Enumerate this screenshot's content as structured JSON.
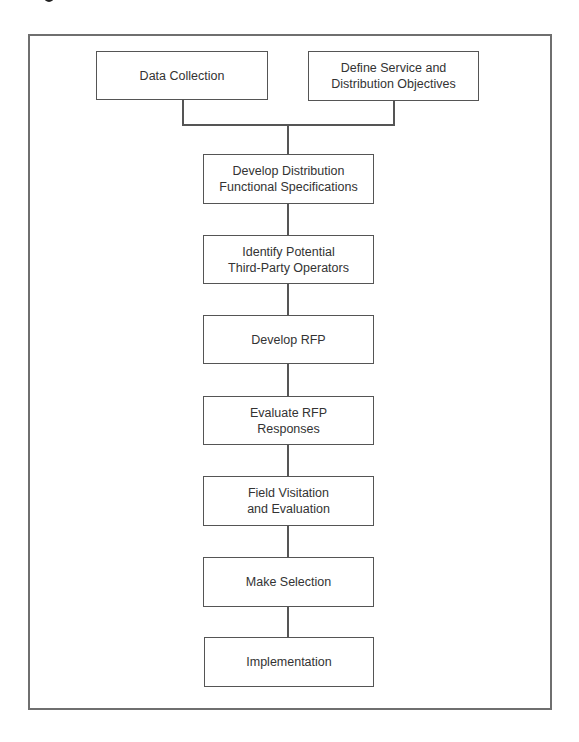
{
  "diagram": {
    "type": "flowchart",
    "colors": {
      "frame": "#6f6f6f",
      "box_border": "#555555",
      "text": "#333333",
      "background": "#ffffff"
    },
    "top_row": [
      {
        "id": "data-collection",
        "label": "Data Collection"
      },
      {
        "id": "define-objectives",
        "label": "Define Service and\nDistribution Objectives"
      }
    ],
    "steps": [
      {
        "id": "functional-specs",
        "label": "Develop Distribution\nFunctional Specifications"
      },
      {
        "id": "identify-operators",
        "label": "Identify Potential\nThird-Party Operators"
      },
      {
        "id": "develop-rfp",
        "label": "Develop RFP"
      },
      {
        "id": "evaluate-rfp",
        "label": "Evaluate RFP\nResponses"
      },
      {
        "id": "field-visitation",
        "label": "Field Visitation\nand Evaluation"
      },
      {
        "id": "make-selection",
        "label": "Make Selection"
      },
      {
        "id": "implementation",
        "label": "Implementation"
      }
    ],
    "edges": [
      [
        "data-collection",
        "functional-specs"
      ],
      [
        "define-objectives",
        "functional-specs"
      ],
      [
        "functional-specs",
        "identify-operators"
      ],
      [
        "identify-operators",
        "develop-rfp"
      ],
      [
        "develop-rfp",
        "evaluate-rfp"
      ],
      [
        "evaluate-rfp",
        "field-visitation"
      ],
      [
        "field-visitation",
        "make-selection"
      ],
      [
        "make-selection",
        "implementation"
      ]
    ]
  }
}
